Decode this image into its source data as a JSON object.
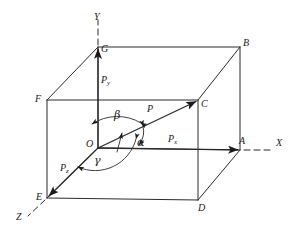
{
  "figure": {
    "type": "vector-decomposition-3d"
  },
  "axes": [
    {
      "id": "x",
      "label": "X"
    },
    {
      "id": "y",
      "label": "Y"
    },
    {
      "id": "z",
      "label": "Z"
    }
  ],
  "vertices": [
    {
      "id": "O",
      "label": "O"
    },
    {
      "id": "A",
      "label": "A"
    },
    {
      "id": "B",
      "label": "B"
    },
    {
      "id": "C",
      "label": "C"
    },
    {
      "id": "D",
      "label": "D"
    },
    {
      "id": "E",
      "label": "E"
    },
    {
      "id": "F",
      "label": "F"
    },
    {
      "id": "G",
      "label": "G"
    }
  ],
  "vectors": [
    {
      "id": "P",
      "label": "P",
      "sub": ""
    },
    {
      "id": "Px",
      "label": "P",
      "sub": "x"
    },
    {
      "id": "Py",
      "label": "P",
      "sub": "y"
    },
    {
      "id": "Pz",
      "label": "P",
      "sub": "z"
    }
  ],
  "angles": [
    {
      "id": "alpha",
      "label": "α"
    },
    {
      "id": "beta",
      "label": "β"
    },
    {
      "id": "gamma",
      "label": "γ"
    }
  ],
  "colors": {
    "ink": "#1a1a1a",
    "line": "#2b2b2b",
    "background": "#ffffff"
  }
}
